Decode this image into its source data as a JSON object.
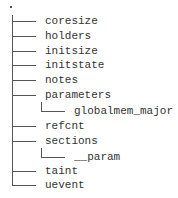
{
  "tree": {
    "root": ".",
    "items": [
      {
        "label": "coresize",
        "depth": 0
      },
      {
        "label": "holders",
        "depth": 0
      },
      {
        "label": "initsize",
        "depth": 0
      },
      {
        "label": "initstate",
        "depth": 0
      },
      {
        "label": "notes",
        "depth": 0
      },
      {
        "label": "parameters",
        "depth": 0
      },
      {
        "label": "globalmem_major",
        "depth": 1
      },
      {
        "label": "refcnt",
        "depth": 0
      },
      {
        "label": "sections",
        "depth": 0
      },
      {
        "label": "__param",
        "depth": 1
      },
      {
        "label": "taint",
        "depth": 0
      },
      {
        "label": "uevent",
        "depth": 0
      }
    ]
  }
}
